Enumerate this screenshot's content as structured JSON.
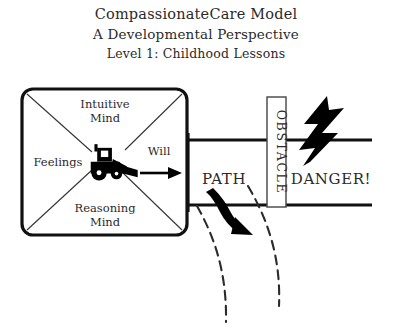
{
  "title": {
    "line1": "CompassionateCare Model",
    "line2": "A Developmental Perspective",
    "line3": "Level 1: Childhood Lessons"
  },
  "model_box": {
    "top_label": "Intuitive",
    "top_label_2": "Mind",
    "left_label": "Feelings",
    "bottom_label": "Reasoning",
    "bottom_label_2": "Mind",
    "right_label": "Will",
    "center_icon": "bulldozer-icon"
  },
  "scene": {
    "path_label": "PATH",
    "obstacle_label": "OBSTACLE",
    "danger_label": "DANGER!",
    "lightning_icon": "lightning-bolt-icon",
    "detour_arrow_icon": "curved-detour-arrow-icon"
  },
  "colors": {
    "ink": "#111111",
    "paper": "#ffffff",
    "text": "#2a2a2a",
    "hairline": "#333333"
  }
}
